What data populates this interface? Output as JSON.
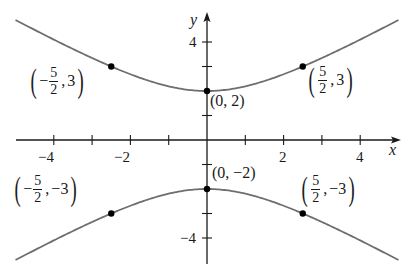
{
  "chart_data": {
    "type": "line",
    "title": "",
    "equation": "y^2/4 - x^2/5 = 1",
    "xlabel": "x",
    "ylabel": "y",
    "xlim": [
      -5,
      5
    ],
    "ylim": [
      -5,
      5
    ],
    "grid": false,
    "legend": null,
    "x_ticks": [
      -4,
      -3,
      -2,
      -1,
      1,
      2,
      3,
      4
    ],
    "x_tick_labels": [
      {
        "value": -4,
        "label": "−4"
      },
      {
        "value": -2,
        "label": "−2"
      },
      {
        "value": 2,
        "label": "2"
      },
      {
        "value": 4,
        "label": "4"
      }
    ],
    "y_ticks": [
      -4,
      -3,
      -2,
      -1,
      1,
      2,
      3,
      4
    ],
    "y_tick_labels": [
      {
        "value": 4,
        "label": "4"
      },
      {
        "value": -4,
        "label": "−4"
      }
    ],
    "series": [
      {
        "name": "upper branch",
        "color": "#6e6e6e",
        "x": [
          -5,
          -4,
          -3,
          -2.5,
          -2,
          -1,
          0,
          1,
          2,
          2.5,
          3,
          4,
          5
        ],
        "y": [
          4.9,
          4.1,
          3.35,
          3.0,
          2.68,
          2.19,
          2.0,
          2.19,
          2.68,
          3.0,
          3.35,
          4.1,
          4.9
        ]
      },
      {
        "name": "lower branch",
        "color": "#6e6e6e",
        "x": [
          -5,
          -4,
          -3,
          -2.5,
          -2,
          -1,
          0,
          1,
          2,
          2.5,
          3,
          4,
          5
        ],
        "y": [
          -4.9,
          -4.1,
          -3.35,
          -3.0,
          -2.68,
          -2.19,
          -2.0,
          -2.19,
          -2.68,
          -3.0,
          -3.35,
          -4.1,
          -4.9
        ]
      }
    ],
    "points": [
      {
        "x": -2.5,
        "y": 3,
        "label": "(−5/2, 3)"
      },
      {
        "x": 0,
        "y": 2,
        "label": "(0, 2)"
      },
      {
        "x": 2.5,
        "y": 3,
        "label": "(5/2, 3)"
      },
      {
        "x": -2.5,
        "y": -3,
        "label": "(−5/2, −3)"
      },
      {
        "x": 0,
        "y": -2,
        "label": "(0, −2)"
      },
      {
        "x": 2.5,
        "y": -3,
        "label": "(5/2, −3)"
      }
    ]
  },
  "labels": {
    "x_axis": "x",
    "y_axis": "y",
    "xt_m4": "−4",
    "xt_m2": "−2",
    "xt_2": "2",
    "xt_4": "4",
    "yt_4": "4",
    "yt_m4": "−4",
    "open": "(",
    "close": ")",
    "minus": "−",
    "comma": ",",
    "five": "5",
    "two": "2",
    "three": "3",
    "neg_three": "−3",
    "p_0_2": "(0, 2)",
    "p_0_m2": "(0, −2)"
  },
  "colors": {
    "curve": "#6e6e6e",
    "axis": "#1a1a1a",
    "point": "#000000"
  }
}
